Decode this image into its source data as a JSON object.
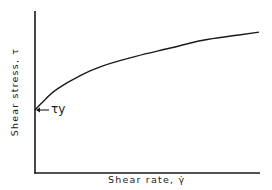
{
  "chart_data": {
    "type": "line",
    "title": "",
    "xlabel": "Shear rate, γ̇",
    "ylabel": "Shear stress, τ",
    "grid": false,
    "legend": null,
    "ticks": {
      "x": [],
      "y": []
    },
    "series": [
      {
        "name": "Shear stress vs shear rate (yield-stress fluid)",
        "x": [
          0,
          0.05,
          0.1,
          0.2,
          0.3,
          0.45,
          0.6,
          0.75,
          0.9,
          1.0
        ],
        "y": [
          0.39,
          0.46,
          0.52,
          0.6,
          0.66,
          0.72,
          0.77,
          0.82,
          0.85,
          0.87
        ]
      }
    ],
    "annotations": [
      {
        "text": "τy",
        "x": 0,
        "y": 0.39,
        "arrow": "left-pointing to y-axis intercept"
      }
    ],
    "xlim": [
      0,
      1
    ],
    "ylim": [
      0,
      1
    ],
    "colors": {
      "line": "#1a1a1a",
      "axes": "#1a1a1a",
      "background": "#ffffff"
    }
  },
  "labels": {
    "xlabel": "Shear  rate,  γ̇",
    "ylabel": "Shear  stress,  τ",
    "yield": "τy"
  }
}
